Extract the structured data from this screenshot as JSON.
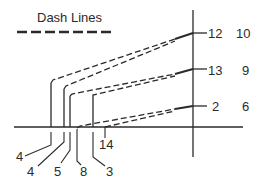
{
  "legend": {
    "label": "Dash Lines",
    "line_style": "dashed"
  },
  "colors": {
    "line": "#2a2a2a",
    "background": "#ffffff"
  },
  "axis_labels_right": [
    {
      "inner": "12",
      "outer": "10"
    },
    {
      "inner": "13",
      "outer": "9"
    },
    {
      "inner": "2",
      "outer": "6"
    }
  ],
  "bottom_labels": [
    {
      "id": "a",
      "text": "4"
    },
    {
      "id": "b",
      "text": "4"
    },
    {
      "id": "c",
      "text": "5"
    },
    {
      "id": "d",
      "text": "8"
    },
    {
      "id": "e",
      "text": "3"
    },
    {
      "id": "f",
      "text": "14"
    }
  ]
}
